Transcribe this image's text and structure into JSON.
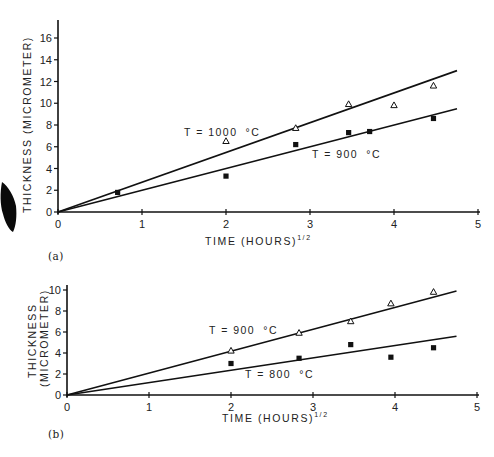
{
  "chart_data": [
    {
      "panel": "(a)",
      "type": "scatter",
      "title": "",
      "xlabel": "TIME (HOURS)^1/2",
      "ylabel": "THICKNESS (MICROMETER)",
      "xlim": [
        0,
        5
      ],
      "ylim": [
        0,
        17
      ],
      "xticks": [
        0,
        1,
        2,
        3,
        4,
        5
      ],
      "yticks": [
        0,
        2,
        4,
        6,
        8,
        10,
        12,
        14,
        16
      ],
      "grid": false,
      "legend": "none (inline annotations)",
      "series": [
        {
          "name": "T = 1000 °C",
          "marker": "open-triangle",
          "x": [
            2.0,
            2.83,
            3.46,
            4.0,
            4.47
          ],
          "y": [
            6.5,
            7.7,
            9.9,
            9.8,
            11.6
          ],
          "fit_line": {
            "x": [
              0,
              4.75
            ],
            "y": [
              0,
              13.0
            ]
          }
        },
        {
          "name": "T = 900 °C",
          "marker": "filled-square",
          "x": [
            0.71,
            2.0,
            2.83,
            3.46,
            3.71,
            4.47
          ],
          "y": [
            1.8,
            3.3,
            6.2,
            7.3,
            7.4,
            8.6
          ],
          "fit_line": {
            "x": [
              0,
              4.75
            ],
            "y": [
              0,
              9.5
            ]
          }
        }
      ],
      "annotations": [
        "T = 1000 °C",
        "T = 900 °C"
      ]
    },
    {
      "panel": "(b)",
      "type": "scatter",
      "title": "",
      "xlabel": "TIME (HOURS)^1/2",
      "ylabel": "THICKNESS (MICROMETER)",
      "xlim": [
        0,
        5
      ],
      "ylim": [
        0,
        10.5
      ],
      "xticks": [
        0,
        1,
        2,
        3,
        4,
        5
      ],
      "yticks": [
        0,
        2,
        4,
        6,
        8,
        10
      ],
      "grid": false,
      "legend": "none (inline annotations)",
      "series": [
        {
          "name": "T = 900 °C",
          "marker": "open-triangle",
          "x": [
            2.0,
            2.83,
            3.46,
            3.95,
            4.47
          ],
          "y": [
            4.2,
            5.9,
            7.0,
            8.7,
            9.8
          ],
          "fit_line": {
            "x": [
              0,
              4.75
            ],
            "y": [
              0,
              9.9
            ]
          }
        },
        {
          "name": "T = 800 °C",
          "marker": "filled-square",
          "x": [
            2.0,
            2.83,
            3.46,
            3.95,
            4.47
          ],
          "y": [
            3.0,
            3.5,
            4.8,
            3.6,
            4.5
          ],
          "fit_line": {
            "x": [
              0,
              4.75
            ],
            "y": [
              0,
              5.6
            ]
          }
        }
      ],
      "annotations": [
        "T = 900 °C",
        "T = 800 °C"
      ]
    }
  ],
  "labels": {
    "panel_a": "(a)",
    "panel_b": "(b)",
    "a_ylabel": "THICKNESS (MICROMETER)",
    "b_ylabel_1": "THICKNESS",
    "b_ylabel_2": "(MICROMETER)",
    "xlabel_main": "TIME (HOURS)",
    "xlabel_sup": "1/2",
    "a_annot_1000": "T = 1000",
    "a_annot_900": "T = 900",
    "b_annot_900": "T = 900",
    "b_annot_800": "T = 800",
    "degC": "°C"
  },
  "ticks": {
    "x": [
      "0",
      "1",
      "2",
      "3",
      "4",
      "5"
    ],
    "a_y": [
      "0",
      "2",
      "4",
      "6",
      "8",
      "10",
      "12",
      "14",
      "16"
    ],
    "b_y": [
      "0",
      "2",
      "4",
      "6",
      "8",
      "10"
    ]
  }
}
